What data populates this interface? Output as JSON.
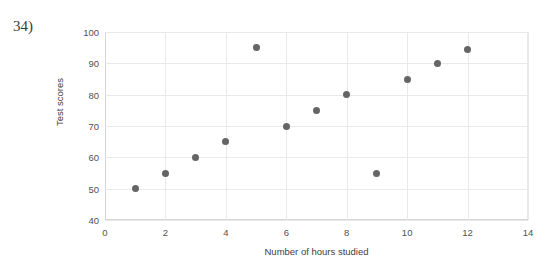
{
  "question": {
    "number_label": "34)"
  },
  "top_fragment": {
    "text": ""
  },
  "chart_data": {
    "type": "scatter",
    "title": "",
    "subtitle": "",
    "xlabel": "Number of hours studied",
    "ylabel": "Test scores",
    "xlim": [
      0,
      14
    ],
    "ylim": [
      40,
      100
    ],
    "xticks": [
      0,
      2,
      4,
      6,
      8,
      10,
      12,
      14
    ],
    "yticks": [
      40,
      50,
      60,
      70,
      80,
      90,
      100
    ],
    "xtick_labels": [
      "0",
      "2",
      "4",
      "6",
      "8",
      "10",
      "12",
      "14"
    ],
    "ytick_labels": [
      "40",
      "50",
      "60",
      "70",
      "80",
      "90",
      "100"
    ],
    "grid": true,
    "grid_color": "#e9e9e9",
    "legend": false,
    "legend_position": "none",
    "marker_color": "#656565",
    "marker_shape": "circle",
    "x": [
      1,
      2,
      3,
      4,
      5,
      6,
      7,
      8,
      9,
      10,
      11,
      12
    ],
    "y": [
      50,
      55,
      60,
      65,
      95,
      70,
      75,
      80,
      55,
      85,
      90,
      94.5
    ],
    "points": [
      {
        "x": 1,
        "y": 50
      },
      {
        "x": 2,
        "y": 55
      },
      {
        "x": 3,
        "y": 60
      },
      {
        "x": 4,
        "y": 65
      },
      {
        "x": 5,
        "y": 95
      },
      {
        "x": 6,
        "y": 70
      },
      {
        "x": 7,
        "y": 75
      },
      {
        "x": 8,
        "y": 80
      },
      {
        "x": 9,
        "y": 55
      },
      {
        "x": 10,
        "y": 85
      },
      {
        "x": 11,
        "y": 90
      },
      {
        "x": 12,
        "y": 94.5
      }
    ],
    "annotations": []
  }
}
